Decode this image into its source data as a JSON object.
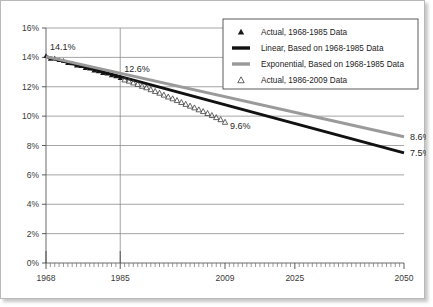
{
  "chart_data": {
    "type": "line",
    "title": "",
    "xlabel": "",
    "ylabel": "",
    "xlim": [
      1968,
      2050
    ],
    "ylim": [
      0,
      16
    ],
    "grid": true,
    "y_ticks": [
      "0%",
      "2%",
      "4%",
      "6%",
      "8%",
      "10%",
      "12%",
      "14%",
      "16%"
    ],
    "y_tick_values": [
      0,
      2,
      4,
      6,
      8,
      10,
      12,
      14,
      16
    ],
    "x_ticks": [
      "1968",
      "1985",
      "2009",
      "2025",
      "2050"
    ],
    "x_tick_values": [
      1968,
      1985,
      2009,
      2025,
      2050
    ],
    "legend_position": "top-right",
    "annotations": [
      {
        "text": "14.1%",
        "x": 1968,
        "y": 14.1
      },
      {
        "text": "12.6%",
        "x": 1985,
        "y": 12.6
      },
      {
        "text": "9.6%",
        "x": 2009,
        "y": 9.6
      },
      {
        "text": "8.6%",
        "x": 2050,
        "y": 8.6
      },
      {
        "text": "7.5%",
        "x": 2050,
        "y": 7.5
      }
    ],
    "series": [
      {
        "name": "Actual, 1968-1985 Data",
        "marker": "filled-triangle",
        "color": "#1a1a1a",
        "x": [
          1968,
          1969,
          1970,
          1971,
          1972,
          1973,
          1974,
          1975,
          1976,
          1977,
          1978,
          1979,
          1980,
          1981,
          1982,
          1983,
          1984,
          1985
        ],
        "values": [
          14.1,
          13.92,
          13.93,
          13.82,
          13.78,
          13.62,
          13.6,
          13.45,
          13.42,
          13.28,
          13.24,
          13.12,
          13.06,
          12.95,
          12.9,
          12.78,
          12.72,
          12.6
        ]
      },
      {
        "name": "Linear, Based on 1968-1985 Data",
        "marker": "thick-line",
        "color": "#111111",
        "x": [
          1968,
          2050
        ],
        "values": [
          14.05,
          7.5
        ]
      },
      {
        "name": "Exponential, Based on 1968-1985 Data",
        "marker": "thick-line",
        "color": "#9a9a9a",
        "x": [
          1968,
          2050
        ],
        "values": [
          14.05,
          8.6
        ]
      },
      {
        "name": "Actual, 1986-2009 Data",
        "marker": "hollow-triangle",
        "color": "#3d3d3d",
        "x": [
          1986,
          1987,
          1988,
          1989,
          1990,
          1991,
          1992,
          1993,
          1994,
          1995,
          1996,
          1997,
          1998,
          1999,
          2000,
          2001,
          2002,
          2003,
          2004,
          2005,
          2006,
          2007,
          2008,
          2009
        ],
        "values": [
          12.48,
          12.4,
          12.28,
          12.18,
          12.05,
          11.95,
          11.82,
          11.7,
          11.58,
          11.45,
          11.32,
          11.2,
          11.08,
          10.95,
          10.82,
          10.7,
          10.58,
          10.45,
          10.33,
          10.2,
          10.06,
          9.92,
          9.78,
          9.6
        ]
      }
    ]
  },
  "legend": {
    "items": [
      {
        "label": "Actual, 1968-1985 Data",
        "marker": "filled-triangle"
      },
      {
        "label": "Linear, Based on 1968-1985 Data",
        "marker": "thick-black-line"
      },
      {
        "label": "Exponential, Based on 1968-1985 Data",
        "marker": "thick-gray-line"
      },
      {
        "label": "Actual, 1986-2009 Data",
        "marker": "hollow-triangle"
      }
    ]
  }
}
